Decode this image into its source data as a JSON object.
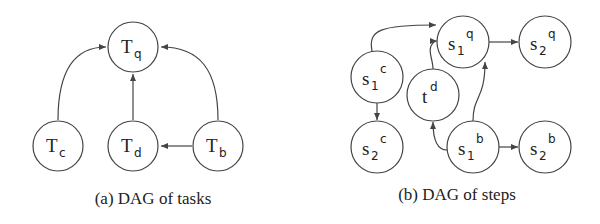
{
  "figures": [
    {
      "id": "a",
      "caption": "(a) DAG of tasks",
      "nodes": [
        {
          "id": "Tq",
          "base": "T",
          "sub": "q",
          "x": 133,
          "y": 47
        },
        {
          "id": "Tc",
          "base": "T",
          "sub": "c",
          "x": 58,
          "y": 146
        },
        {
          "id": "Td",
          "base": "T",
          "sub": "d",
          "x": 133,
          "y": 146
        },
        {
          "id": "Tb",
          "base": "T",
          "sub": "b",
          "x": 218,
          "y": 146
        }
      ],
      "edges": [
        {
          "from": "Tc",
          "to": "Tq"
        },
        {
          "from": "Td",
          "to": "Tq"
        },
        {
          "from": "Tb",
          "to": "Tq"
        },
        {
          "from": "Tb",
          "to": "Td"
        }
      ]
    },
    {
      "id": "b",
      "caption": "(b) DAG of steps",
      "nodes": [
        {
          "id": "s1q",
          "base": "s",
          "sub": "1",
          "sup": "q",
          "x": 463,
          "y": 42
        },
        {
          "id": "s2q",
          "base": "s",
          "sub": "2",
          "sup": "q",
          "x": 545,
          "y": 42
        },
        {
          "id": "s1c",
          "base": "s",
          "sub": "1",
          "sup": "c",
          "x": 377,
          "y": 77
        },
        {
          "id": "td",
          "base": "t",
          "sup": "d",
          "x": 433,
          "y": 95
        },
        {
          "id": "s2c",
          "base": "s",
          "sub": "2",
          "sup": "c",
          "x": 377,
          "y": 147
        },
        {
          "id": "s1b",
          "base": "s",
          "sub": "1",
          "sup": "b",
          "x": 473,
          "y": 147
        },
        {
          "id": "s2b",
          "base": "s",
          "sub": "2",
          "sup": "b",
          "x": 545,
          "y": 147
        }
      ],
      "edges": [
        {
          "from": "s1c",
          "to": "s1q"
        },
        {
          "from": "s1c",
          "to": "s2c"
        },
        {
          "from": "td",
          "to": "s1q"
        },
        {
          "from": "s1q",
          "to": "s2q"
        },
        {
          "from": "s1b",
          "to": "s1q"
        },
        {
          "from": "s1b",
          "to": "td"
        },
        {
          "from": "s1b",
          "to": "s2b"
        }
      ]
    }
  ]
}
